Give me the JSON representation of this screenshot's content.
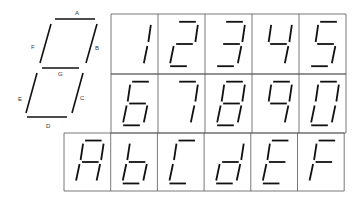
{
  "diagram": {
    "segment_labels": [
      "A",
      "B",
      "C",
      "D",
      "E",
      "F",
      "G"
    ],
    "colors": {
      "ink": "#111111",
      "grid": "#555555",
      "background": "#ffffff"
    },
    "rows": [
      {
        "chars": [
          {
            "char": "1",
            "segments": "BC"
          },
          {
            "char": "2",
            "segments": "ABGED"
          },
          {
            "char": "3",
            "segments": "ABGCD"
          },
          {
            "char": "4",
            "segments": "FGBC"
          },
          {
            "char": "5",
            "segments": "AFGCD"
          }
        ]
      },
      {
        "chars": [
          {
            "char": "6",
            "segments": "AFGECD"
          },
          {
            "char": "7",
            "segments": "ABC"
          },
          {
            "char": "8",
            "segments": "ABCDEFG"
          },
          {
            "char": "9",
            "segments": "AFGBC"
          },
          {
            "char": "0",
            "segments": "ABCDEF"
          }
        ]
      },
      {
        "chars": [
          {
            "char": "A",
            "segments": "ABCEFG"
          },
          {
            "char": "b",
            "segments": "FEGCD"
          },
          {
            "char": "C",
            "segments": "AFED"
          },
          {
            "char": "d",
            "segments": "BCGED"
          },
          {
            "char": "E",
            "segments": "AFGED"
          },
          {
            "char": "F",
            "segments": "AFGE"
          }
        ]
      }
    ]
  }
}
